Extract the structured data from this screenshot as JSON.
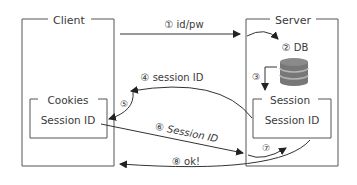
{
  "client": {
    "title": "Client",
    "cookies": {
      "title": "Cookies",
      "content": "Session ID"
    }
  },
  "server": {
    "title": "Server",
    "db_label": "② DB",
    "session": {
      "title": "Session",
      "content": "Session ID"
    }
  },
  "steps": {
    "s1": "① id/pw",
    "s3": "③",
    "s4": "④ session ID",
    "s5": "⑤",
    "s6": "⑥ Session ID",
    "s7": "⑦",
    "s8": "⑧ ok!"
  },
  "colors": {
    "line": "#333333",
    "box": "#555555",
    "db_top": "#8a8a8a",
    "db_body": "#777777"
  }
}
